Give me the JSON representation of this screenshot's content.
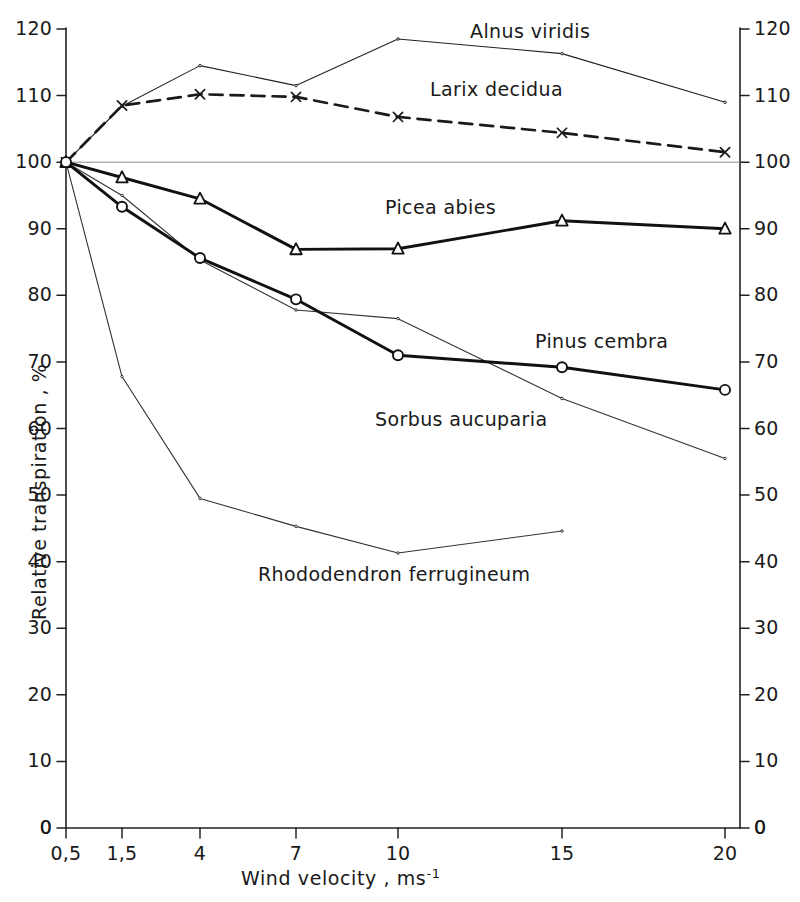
{
  "chart_data": {
    "type": "line",
    "title": "",
    "xlabel": "Wind velocity ,  ms",
    "xlabel_sup": "-1",
    "ylabel": "Relative transpiration ,  %",
    "x_tick_labels": [
      "0,5",
      "1,5",
      "4",
      "7",
      "10",
      "15",
      "20"
    ],
    "x_tick_values": [
      0.5,
      1.5,
      4,
      7,
      10,
      15,
      20
    ],
    "y_tick_labels": [
      "0",
      "10",
      "20",
      "30",
      "40",
      "50",
      "60",
      "70",
      "80",
      "90",
      "100",
      "110",
      "120"
    ],
    "y_tick_values": [
      0,
      10,
      20,
      30,
      40,
      50,
      60,
      70,
      80,
      90,
      100,
      110,
      120
    ],
    "ylim": [
      0,
      123
    ],
    "grid": false,
    "reference_line": 100,
    "legend_position": "inline-annotations",
    "axis_right_mirrored": true,
    "series": [
      {
        "name": "Alnus viridis",
        "style": "thin-solid",
        "marker": "dot",
        "color": "#222222",
        "x": [
          0.5,
          1.5,
          4,
          7,
          10,
          15,
          20
        ],
        "values": [
          100,
          108.4,
          114.5,
          111.5,
          118.5,
          116.3,
          109.0
        ],
        "label_x": 470,
        "label_y": 20
      },
      {
        "name": "Larix decidua",
        "style": "dashed",
        "marker": "x",
        "color": "#1a1a1a",
        "x": [
          0.5,
          1.5,
          4,
          7,
          10,
          15,
          20
        ],
        "values": [
          100,
          108.5,
          110.2,
          109.8,
          106.8,
          104.4,
          101.5
        ],
        "label_x": 430,
        "label_y": 78
      },
      {
        "name": "Picea abies",
        "style": "thick-solid",
        "marker": "triangle",
        "color": "#111111",
        "x": [
          0.5,
          1.5,
          4,
          7,
          10,
          15,
          20
        ],
        "values": [
          100,
          97.7,
          94.5,
          86.9,
          87.0,
          91.2,
          90.0
        ],
        "label_x": 385,
        "label_y": 196
      },
      {
        "name": "Pinus cembra",
        "style": "thick-solid",
        "marker": "circle",
        "color": "#111111",
        "x": [
          0.5,
          1.5,
          4,
          7,
          10,
          15,
          20
        ],
        "values": [
          100,
          93.3,
          85.6,
          79.4,
          71.0,
          69.2,
          65.8
        ],
        "label_x": 535,
        "label_y": 330
      },
      {
        "name": "Sorbus aucuparia",
        "style": "thin-solid",
        "marker": "dot",
        "color": "#333333",
        "x": [
          0.5,
          1.5,
          4,
          7,
          10,
          15,
          20
        ],
        "values": [
          100,
          95.0,
          85.3,
          77.8,
          76.5,
          64.5,
          55.5
        ],
        "label_x": 375,
        "label_y": 408
      },
      {
        "name": "Rhododendron ferrugineum",
        "style": "thin-solid",
        "marker": "dot",
        "color": "#333333",
        "x": [
          0.5,
          1.5,
          4,
          7,
          10,
          15
        ],
        "values": [
          100,
          67.8,
          49.5,
          45.3,
          41.3,
          44.6
        ],
        "label_x": 258,
        "label_y": 563
      }
    ]
  }
}
